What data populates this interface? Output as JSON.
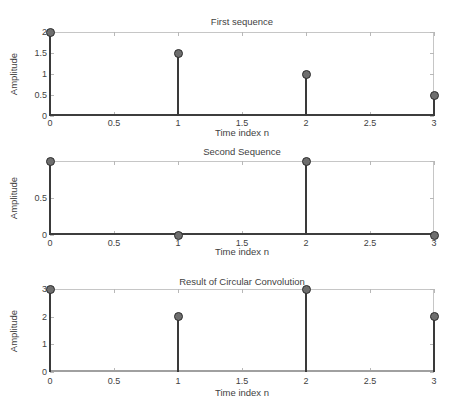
{
  "figure_title": "Circular Convolution Stem Plots",
  "colors": {
    "background": "#ffffff",
    "stem": "#3a3a3a",
    "marker_fill": "#6e6e6e",
    "marker_edge": "#2d2d2d",
    "box": "#c6c6c6",
    "tick": "#b8b8b8",
    "text": "#3f3f3f"
  },
  "chart_data": [
    {
      "type": "stem",
      "title": "First sequence",
      "xlabel": "Time index n",
      "ylabel": "Amplitude",
      "x": [
        0,
        1,
        2,
        3
      ],
      "values": [
        2,
        1.5,
        1,
        0.5
      ],
      "xlim": [
        0,
        3
      ],
      "ylim": [
        0,
        2
      ],
      "xticks": [
        0,
        0.5,
        1,
        1.5,
        2,
        2.5,
        3
      ],
      "xtick_labels": [
        "0",
        "0.5",
        "1",
        "1.5",
        "2",
        "2.5",
        "3"
      ],
      "yticks": [
        0,
        0.5,
        1,
        1.5,
        2
      ],
      "ytick_labels": [
        "0",
        "0.5",
        "1",
        "1.5",
        "2"
      ],
      "baseline_color": "#3d3d3d",
      "grid": false,
      "legend": null
    },
    {
      "type": "stem",
      "title": "Second Sequence",
      "xlabel": "Time index n",
      "ylabel": "Amplitude",
      "x": [
        0,
        1,
        2,
        3
      ],
      "values": [
        1,
        0,
        1,
        0
      ],
      "xlim": [
        0,
        3
      ],
      "ylim": [
        0,
        1
      ],
      "xticks": [
        0,
        0.5,
        1,
        1.5,
        2,
        2.5,
        3
      ],
      "xtick_labels": [
        "0",
        "0.5",
        "1",
        "1.5",
        "2",
        "2.5",
        "3"
      ],
      "yticks": [
        0,
        0.5,
        1
      ],
      "ytick_labels": [
        "0",
        "0.5",
        ""
      ],
      "baseline_color": "#3d3d3d",
      "grid": false,
      "legend": null
    },
    {
      "type": "stem",
      "title": "Result of Circular Convolution",
      "xlabel": "Time index n",
      "ylabel": "Amplitude",
      "x": [
        0,
        1,
        2,
        3
      ],
      "values": [
        3,
        2,
        3,
        2
      ],
      "xlim": [
        0,
        3
      ],
      "ylim": [
        0,
        3
      ],
      "xticks": [
        0,
        0.5,
        1,
        1.5,
        2,
        2.5,
        3
      ],
      "xtick_labels": [
        "0",
        "0.5",
        "1",
        "1.5",
        "2",
        "2.5",
        "3"
      ],
      "yticks": [
        0,
        1,
        2,
        3
      ],
      "ytick_labels": [
        "0",
        "1",
        "2",
        "3"
      ],
      "baseline_color": "#a0a0a0",
      "grid": false,
      "legend": null
    }
  ]
}
